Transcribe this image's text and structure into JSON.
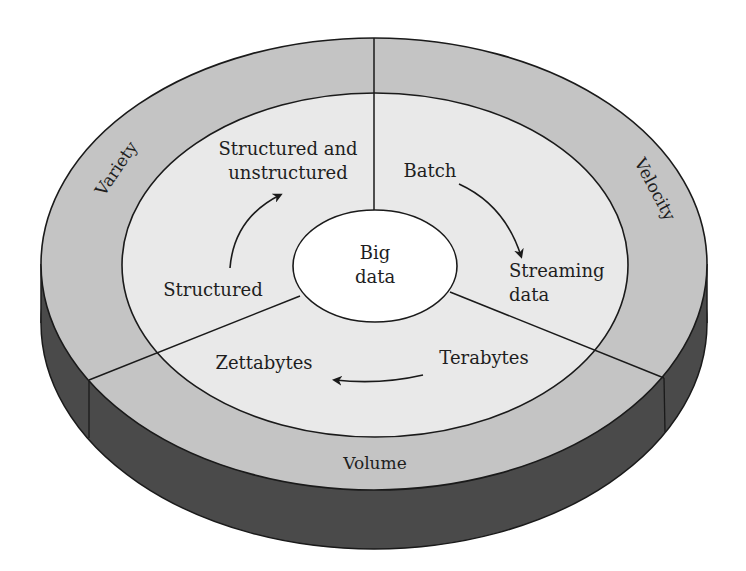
{
  "diagram": {
    "center": {
      "line1": "Big",
      "line2": "data"
    },
    "dimensions": [
      {
        "id": "variety",
        "ring_label": "Variety",
        "from": "Structured",
        "to_line1": "Structured and",
        "to_line2": "unstructured"
      },
      {
        "id": "velocity",
        "ring_label": "Velocity",
        "from": "Batch",
        "to_line1": "Streaming",
        "to_line2": "data"
      },
      {
        "id": "volume",
        "ring_label": "Volume",
        "from": "Terabytes",
        "to": "Zettabytes"
      }
    ],
    "colors": {
      "outer_ring": "#c4c4c4",
      "inner_disc": "#e9e9e9",
      "center": "#ffffff",
      "side": "#4a4a4a",
      "stroke": "#1a1a1a"
    }
  }
}
